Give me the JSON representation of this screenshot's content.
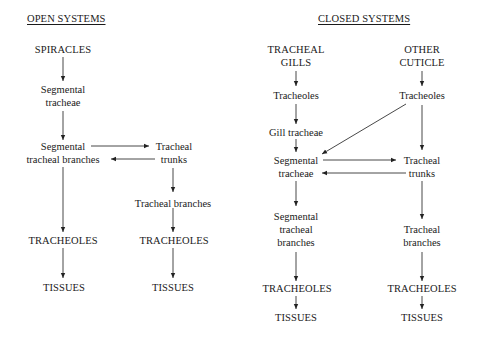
{
  "open_systems": {
    "heading": "OPEN SYSTEMS",
    "nodes": {
      "spiracles": "SPIRACLES",
      "segmental_tracheae_1": "Segmental",
      "segmental_tracheae_2": "tracheae",
      "seg_branches_1": "Segmental",
      "seg_branches_2": "tracheal branches",
      "trunks_1": "Tracheal",
      "trunks_2": "trunks",
      "tracheal_branches": "Tracheal branches",
      "tracheoles_left": "TRACHEOLES",
      "tracheoles_right": "TRACHEOLES",
      "tissues_left": "TISSUES",
      "tissues_right": "TISSUES"
    }
  },
  "closed_systems": {
    "heading": "CLOSED SYSTEMS",
    "nodes": {
      "gills_1": "TRACHEAL",
      "gills_2": "GILLS",
      "other_1": "OTHER",
      "other_2": "CUTICLE",
      "tracheoles_gill": "Tracheoles",
      "tracheoles_other": "Tracheoles",
      "gill_tracheae": "Gill tracheae",
      "seg_tracheae_1": "Segmental",
      "seg_tracheae_2": "tracheae",
      "trunks_1": "Tracheal",
      "trunks_2": "trunks",
      "seg_branches_1": "Segmental",
      "seg_branches_2": "tracheal",
      "seg_branches_3": "branches",
      "tr_branches_1": "Tracheal",
      "tr_branches_2": "branches",
      "tracheoles_left": "TRACHEOLES",
      "tracheoles_right": "TRACHEOLES",
      "tissues_left": "TISSUES",
      "tissues_right": "TISSUES"
    }
  }
}
